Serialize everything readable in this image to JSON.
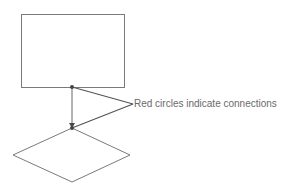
{
  "diagram": {
    "colors": {
      "stroke": "#7a7a7a",
      "connector": "#555555",
      "text": "#6a6a6a"
    },
    "shapes": [
      {
        "id": "process-box",
        "type": "rectangle",
        "x": 21,
        "y": 14,
        "width": 103,
        "height": 73
      },
      {
        "id": "decision-diamond",
        "type": "diamond",
        "top": [
          72,
          128
        ],
        "right": [
          130,
          155
        ],
        "bottom": [
          72,
          182
        ],
        "left": [
          13,
          155
        ]
      }
    ],
    "connections": [
      {
        "from": "process-box",
        "to": "decision-diamond",
        "from_point": [
          72,
          87
        ],
        "to_point": [
          72,
          128
        ],
        "arrow": "end"
      }
    ],
    "connection_points": [
      {
        "x": 72,
        "y": 87
      },
      {
        "x": 72,
        "y": 128
      }
    ],
    "callout": {
      "text": "Red circles indicate connections",
      "apex": [
        133,
        104
      ]
    }
  }
}
